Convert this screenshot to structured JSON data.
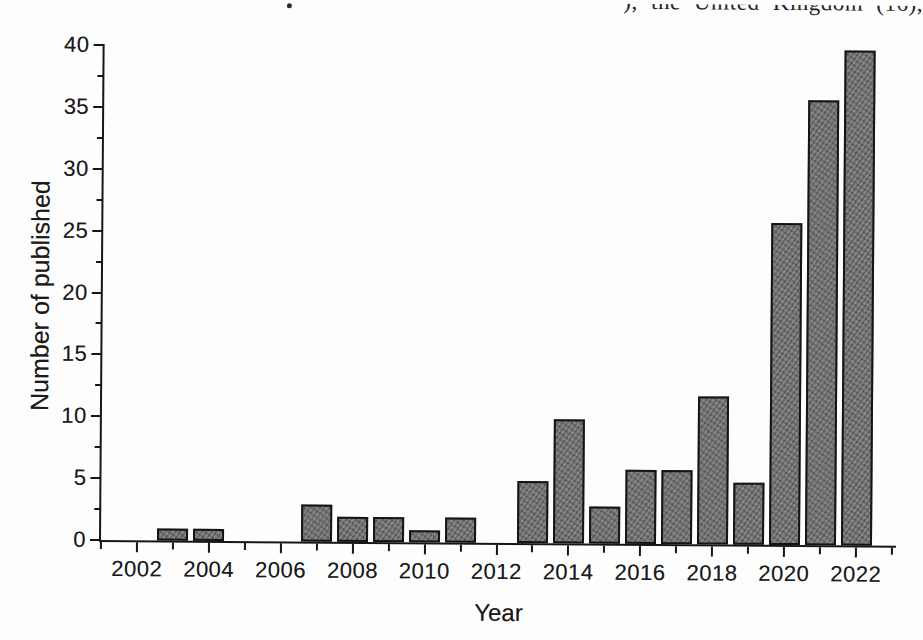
{
  "top_text": {
    "fragment": "), the United Kingdom (16),"
  },
  "chart_data": {
    "type": "bar",
    "title": "",
    "xlabel": "Year",
    "ylabel": "Number of published",
    "categories": [
      2002,
      2003,
      2004,
      2005,
      2006,
      2007,
      2008,
      2009,
      2010,
      2011,
      2012,
      2013,
      2014,
      2015,
      2016,
      2017,
      2018,
      2019,
      2020,
      2021,
      2022
    ],
    "values": [
      0,
      1,
      1,
      0,
      0,
      3,
      2,
      2,
      1,
      2,
      0,
      5,
      10,
      3,
      6,
      6,
      12,
      5,
      26,
      36,
      40
    ],
    "ylim": [
      0,
      40
    ],
    "ytick_step": 5,
    "yminor_step": 2.5,
    "ytick_labels": [
      "0",
      "5",
      "10",
      "15",
      "20",
      "25",
      "30",
      "35",
      "40"
    ],
    "xtick_labeled_years": [
      2002,
      2004,
      2006,
      2008,
      2010,
      2012,
      2014,
      2016,
      2018,
      2020,
      2022
    ],
    "xminor_years": [
      2001,
      2003,
      2005,
      2007,
      2009,
      2011,
      2013,
      2015,
      2017,
      2019,
      2021,
      2023
    ],
    "grid": false,
    "legend": null,
    "bar_fill_color": "#737373",
    "bar_border_color": "#141414",
    "axis_color": "#161616",
    "text_color": "#1b1b1b"
  }
}
